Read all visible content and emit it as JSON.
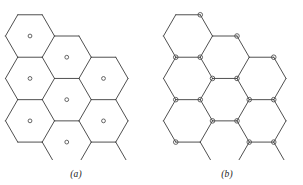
{
  "figure": {
    "type": "diagram",
    "background_color": "#ffffff",
    "line_color": "#3c3c3c",
    "circle_color": "#4a4a4a"
  },
  "panels": [
    {
      "id": "a",
      "caption": "(a)",
      "site_placement": "hexagon-centers",
      "hexagon_count": 9,
      "circle_count": 9,
      "orientation": "flat-top",
      "arrangement": "rhombic 3x3"
    },
    {
      "id": "b",
      "caption": "(b)",
      "site_placement": "hexagon-vertices",
      "hexagon_count": 9,
      "circle_count": 21,
      "orientation": "flat-top",
      "arrangement": "rhombic 3x3"
    }
  ],
  "geometry": {
    "hex_radius": 24.5,
    "panel_a_origin_x": 30.0,
    "panel_a_origin_y": 36.0,
    "panel_b_origin_x": 37.0,
    "panel_b_origin_y": 36.0,
    "site_radius_a": 1.9,
    "site_radius_b": 2.3,
    "row_offsets": [
      0,
      1,
      2
    ]
  }
}
